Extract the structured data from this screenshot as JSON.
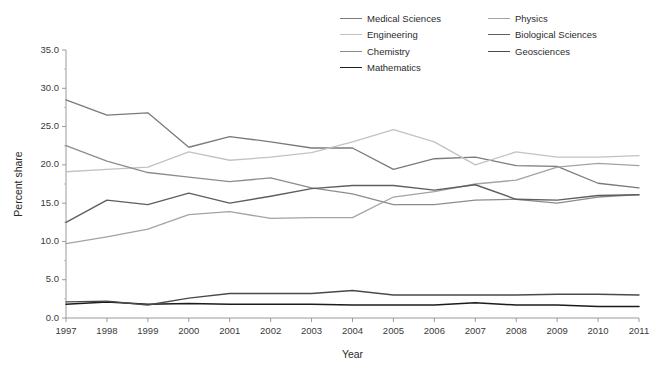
{
  "chart_data": {
    "type": "line",
    "title": "",
    "xlabel": "Year",
    "ylabel": "Percent share",
    "x": [
      1997,
      1998,
      1999,
      2000,
      2001,
      2002,
      2003,
      2004,
      2005,
      2006,
      2007,
      2008,
      2009,
      2010,
      2011
    ],
    "categories": [
      "1997",
      "1998",
      "1999",
      "2000",
      "2001",
      "2002",
      "2003",
      "2004",
      "2005",
      "2006",
      "2007",
      "2008",
      "2009",
      "2010",
      "2011"
    ],
    "xlim": [
      1997,
      2011
    ],
    "ylim": [
      0.0,
      35.0
    ],
    "yticks": [
      "0.0",
      "5.0",
      "10.0",
      "15.0",
      "20.0",
      "25.0",
      "30.0",
      "35.0"
    ],
    "ytick_values": [
      0,
      5,
      10,
      15,
      20,
      25,
      30,
      35
    ],
    "grid": false,
    "legend_position": "top-right",
    "series": [
      {
        "name": "Medical Sciences",
        "color": "#7a7a7a",
        "width": 1.3,
        "values": [
          28.5,
          26.5,
          26.8,
          22.3,
          23.7,
          23.0,
          22.2,
          22.2,
          19.4,
          20.8,
          21.0,
          19.9,
          19.8,
          17.6,
          17.0
        ]
      },
      {
        "name": "Engineering",
        "color": "#c2c2c2",
        "width": 1.3,
        "values": [
          19.1,
          19.4,
          19.7,
          21.7,
          20.6,
          21.0,
          21.6,
          23.0,
          24.6,
          23.0,
          20.0,
          21.7,
          21.0,
          21.0,
          21.2
        ]
      },
      {
        "name": "Chemistry",
        "color": "#8c8c8c",
        "width": 1.3,
        "values": [
          22.5,
          20.5,
          19.0,
          18.4,
          17.8,
          18.3,
          17.0,
          16.2,
          14.8,
          14.8,
          15.4,
          15.5,
          15.0,
          15.8,
          16.1
        ]
      },
      {
        "name": "Mathematics",
        "color": "#1c1c1c",
        "width": 1.5,
        "values": [
          1.8,
          2.1,
          1.8,
          1.9,
          1.8,
          1.8,
          1.8,
          1.7,
          1.7,
          1.7,
          2.0,
          1.7,
          1.7,
          1.5,
          1.5
        ]
      },
      {
        "name": "Physics",
        "color": "#a3a3a3",
        "width": 1.3,
        "values": [
          9.7,
          10.6,
          11.6,
          13.5,
          13.9,
          13.0,
          13.1,
          13.1,
          15.8,
          16.5,
          17.5,
          18.0,
          19.7,
          20.2,
          19.9
        ]
      },
      {
        "name": "Biological Sciences",
        "color": "#5e5e5e",
        "width": 1.4,
        "values": [
          12.5,
          15.4,
          14.8,
          16.3,
          15.0,
          15.9,
          16.9,
          17.3,
          17.3,
          16.7,
          17.4,
          15.5,
          15.4,
          16.0,
          16.1
        ]
      },
      {
        "name": "Geosciences",
        "color": "#4a4a4a",
        "width": 1.4,
        "values": [
          2.1,
          2.2,
          1.7,
          2.6,
          3.2,
          3.2,
          3.2,
          3.6,
          3.0,
          3.0,
          3.0,
          3.0,
          3.1,
          3.1,
          3.0
        ]
      }
    ]
  },
  "legend": {
    "items": [
      {
        "label": "Medical Sciences",
        "color": "#7a7a7a",
        "width": 1.4,
        "col": 1,
        "row": 1
      },
      {
        "label": "Physics",
        "color": "#a3a3a3",
        "width": 1.2,
        "col": 2,
        "row": 1
      },
      {
        "label": "Engineering",
        "color": "#c2c2c2",
        "width": 1.2,
        "col": 1,
        "row": 2
      },
      {
        "label": "Biological Sciences",
        "color": "#5e5e5e",
        "width": 1.5,
        "col": 2,
        "row": 2
      },
      {
        "label": "Chemistry",
        "color": "#8c8c8c",
        "width": 1.4,
        "col": 1,
        "row": 3
      },
      {
        "label": "Geosciences",
        "color": "#4a4a4a",
        "width": 1.6,
        "col": 2,
        "row": 3
      },
      {
        "label": "Mathematics",
        "color": "#1c1c1c",
        "width": 1.9,
        "col": 1,
        "row": 4
      }
    ]
  }
}
